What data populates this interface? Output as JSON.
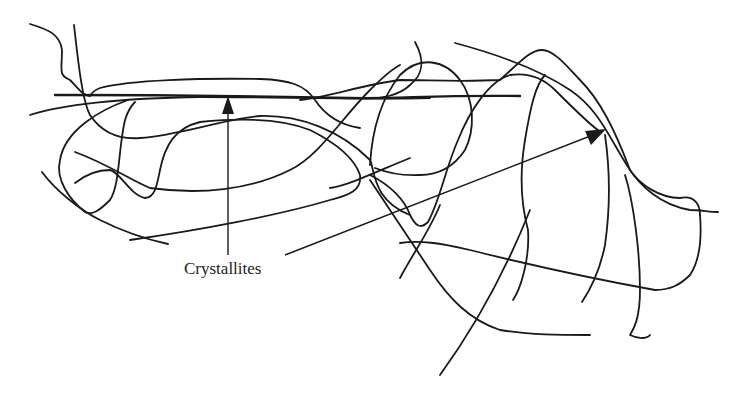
{
  "diagram": {
    "type": "polymer-chain-schematic",
    "label": "Crystallites",
    "annotations": [
      {
        "text": "Crystallites",
        "points_to": [
          "aligned chain region upper-left",
          "aligned chain region upper-right"
        ]
      }
    ],
    "colors": {
      "line": "#1a1a1a",
      "background": "#ffffff"
    }
  }
}
